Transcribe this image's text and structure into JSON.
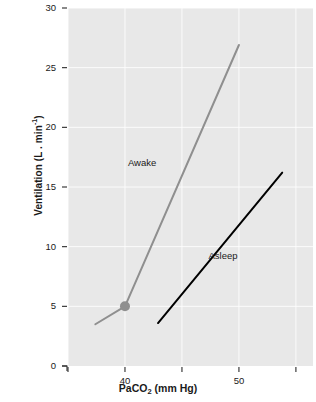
{
  "chart_data": {
    "type": "line",
    "title": "",
    "xlabel": "PaCO2 (mm Hg)",
    "xlabel_main": "PaCO",
    "xlabel_sub": "2",
    "xlabel_units": " (mm Hg)",
    "ylabel": "Ventilation (L.min-1)",
    "ylabel_main": "Ventilation (L . min",
    "ylabel_sup": "-1",
    "ylabel_tail": ")",
    "xlim": [
      35,
      56.5
    ],
    "ylim": [
      0,
      30
    ],
    "xticks": [
      35,
      40,
      45,
      50,
      55
    ],
    "xtick_labels": [
      "",
      "40",
      "",
      "50",
      ""
    ],
    "yticks": [
      0,
      5,
      10,
      15,
      20,
      25,
      30
    ],
    "ytick_labels": [
      "0",
      "5",
      "10",
      "15",
      "20",
      "25",
      "30"
    ],
    "grid": true,
    "grid_color": "#ffffff",
    "panel_background": "#e8e8e8",
    "legend_position": "inline-annotations",
    "series": [
      {
        "name": "Awake",
        "label": "Awake",
        "color": "#8f8f8f",
        "line_width": 2,
        "points": [
          {
            "x": 37.4,
            "y": 3.5
          },
          {
            "x": 40.0,
            "y": 5.0
          },
          {
            "x": 50.0,
            "y": 26.9
          }
        ],
        "marker": {
          "x": 40.0,
          "y": 5.0,
          "shape": "circle",
          "radius": 5,
          "color": "#8f8f8f"
        },
        "label_position": {
          "x": 41.5,
          "y": 16.8
        }
      },
      {
        "name": "Asleep",
        "label": "Asleep",
        "color": "#000000",
        "line_width": 2,
        "points": [
          {
            "x": 42.9,
            "y": 3.6
          },
          {
            "x": 53.8,
            "y": 16.2
          }
        ],
        "marker": null,
        "label_position": {
          "x": 48.6,
          "y": 9.0
        }
      }
    ],
    "annotations": []
  },
  "figure": {
    "name": "ventilation-paco2-response-chart",
    "background": "#ffffff"
  }
}
